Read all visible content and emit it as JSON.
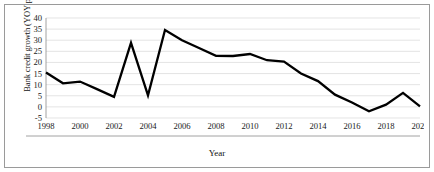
{
  "chart_data": {
    "type": "line",
    "title": "",
    "xlabel": "Year",
    "ylabel": "Bank credit growth (YOY per cent)",
    "x": [
      1998,
      1999,
      2000,
      2001,
      2002,
      2003,
      2004,
      2005,
      2006,
      2007,
      2008,
      2009,
      2010,
      2011,
      2012,
      2013,
      2014,
      2015,
      2016,
      2017,
      2018,
      2019,
      2020
    ],
    "values": [
      15.5,
      10.6,
      11.4,
      8.0,
      4.5,
      28.8,
      5.2,
      34.6,
      30.0,
      26.5,
      23.0,
      22.9,
      23.8,
      21.0,
      20.4,
      15.0,
      11.6,
      5.5,
      2.0,
      -2.0,
      1.0,
      6.3,
      0.2
    ],
    "series": [
      {
        "name": "Bank credit growth (YOY per cent)",
        "values": [
          15.5,
          10.6,
          11.4,
          8.0,
          4.5,
          28.8,
          5.2,
          34.6,
          30.0,
          26.5,
          23.0,
          22.9,
          23.8,
          21.0,
          20.4,
          15.0,
          11.6,
          5.5,
          2.0,
          -2.0,
          1.0,
          6.3,
          0.2
        ]
      }
    ],
    "xlim": [
      1998,
      2020
    ],
    "ylim": [
      -5,
      40
    ],
    "ytick_labels": [
      "40",
      "35",
      "30",
      "25",
      "20",
      "15",
      "10",
      "5",
      "0",
      "-5"
    ],
    "ytick_values": [
      40,
      35,
      30,
      25,
      20,
      15,
      10,
      5,
      0,
      -5
    ],
    "xtick_labels": [
      "1998",
      "2000",
      "2002",
      "2004",
      "2006",
      "2008",
      "2010",
      "2012",
      "2014",
      "2016",
      "2018",
      "2020"
    ],
    "xtick_values": [
      1998,
      2000,
      2002,
      2004,
      2006,
      2008,
      2010,
      2012,
      2014,
      2016,
      2018,
      2020
    ],
    "grid": "horizontal",
    "legend": "none",
    "line_color": "#000000",
    "grid_color": "#d9d9d9"
  }
}
